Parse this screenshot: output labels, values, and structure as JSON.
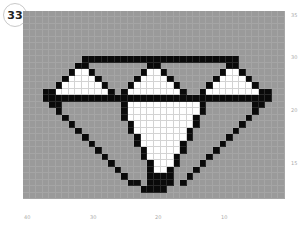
{
  "badge": {
    "number": "33"
  },
  "axes": {
    "right_ticks": [
      {
        "label": "35",
        "y": 12
      },
      {
        "label": "30",
        "y": 54
      },
      {
        "label": "20",
        "y": 107
      },
      {
        "label": "15",
        "y": 160
      }
    ],
    "bottom_ticks": [
      {
        "label": "40",
        "x": 24
      },
      {
        "label": "30",
        "x": 90
      },
      {
        "label": "20",
        "x": 155
      },
      {
        "label": "10",
        "x": 221
      }
    ]
  },
  "colors": {
    "background": "#9a9a9a",
    "filled": "#0a0a0a",
    "white": "#ffffff"
  },
  "pattern": {
    "cols": 40,
    "rows": 29,
    "legend": {
      ".": "gray",
      "B": "black",
      "W": "white"
    },
    "grid": [
      "........................................",
      "........................................",
      "........................................",
      "........................................",
      "........................................",
      "........................................",
      "........................................",
      ".........BBBBBBBBBBBBBBBBBBBBBBBB.......",
      "........BB.........BB..........BB.......",
      ".......BWWB.......BWWB........BWWB......",
      "......BWWWWB.....BWWWWB......BWWWWB.....",
      ".....BWWWWWWB...BWWWWWWB....BWWWWWWB....",
      "...BBWWWWWWWWB.BWWWWWWWWB..BWWWWWWWWBB..",
      "...BBBBBBBBBBBBBBBBBBBBBBBBBBBBBBBBBBB..",
      "....BB.........BWWWWWWWWWWWB.......BB...",
      ".....B.........BWWWWWWWWWWWB.......B....",
      "......B........BWWWWWWWWWWB.......B.....",
      ".......B........BWWWWWWWWWB......B......",
      "........B.......BWWWWWWWWB......B.......",
      ".........B.......BWWWWWWWB.....B........",
      "..........B......BWWWWWWB.....B.........",
      "...........B......BWWWWWB....B..........",
      "............B.....BWWWWB....B...........",
      ".............B.....BWWWB...B............",
      "..............B....BWWB...B.............",
      "...............B...BBBB..B..............",
      "................BB.BBBB.B...............",
      "..................BBBB..................",
      "........................................"
    ]
  }
}
